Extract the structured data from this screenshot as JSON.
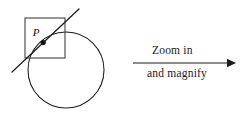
{
  "figure": {
    "point_label": "P",
    "caption_above_arrow": "Zoom in",
    "caption_below_arrow": "and magnify",
    "colors": {
      "stroke": "#1c1c1c",
      "box_stroke": "#3a3a3a",
      "point": "#101010",
      "background": "#ffffff",
      "text": "#1a1a1a"
    },
    "geometry": {
      "circle": {
        "center_x": 66,
        "center_y": 70,
        "radius": 38
      },
      "inset_square": {
        "x": 25,
        "y": 18,
        "width": 40,
        "height": 40
      },
      "tangent_point": {
        "x": 43.2,
        "y": 42.6
      },
      "tangent_line": {
        "x1": 12,
        "y1": 72,
        "x2": 79,
        "y2": 9
      },
      "arrow": {
        "x1": 133,
        "y1": 63,
        "x2": 236,
        "y2": 63
      }
    }
  }
}
